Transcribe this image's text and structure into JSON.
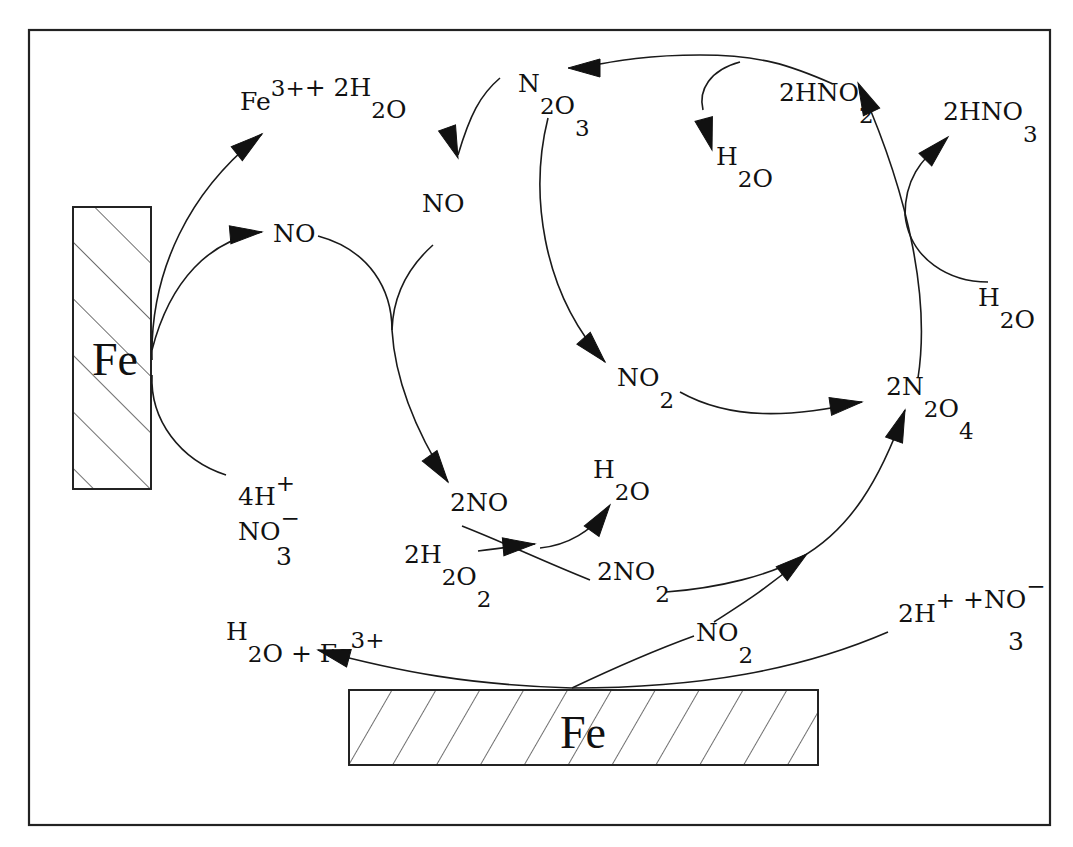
{
  "diagram": {
    "type": "reaction-mechanism",
    "frame": {
      "x": 29,
      "y": 30,
      "width": 1021,
      "height": 795
    },
    "colors": {
      "ink": "#111111",
      "background": "#ffffff"
    },
    "electrodes": [
      {
        "id": "fe-left",
        "label": "Fe",
        "x": 73,
        "y": 207,
        "width": 78,
        "height": 282,
        "hatch": "forward"
      },
      {
        "id": "fe-bottom",
        "label": "Fe",
        "x": 349,
        "y": 690,
        "width": 469,
        "height": 75,
        "hatch": "backward"
      }
    ],
    "species": [
      {
        "id": "fe3-2h2o-top",
        "parts": [
          [
            "Fe",
            ""
          ],
          [
            "3+",
            "sup"
          ],
          [
            "+ 2H",
            ""
          ],
          [
            "2",
            "sub"
          ],
          [
            "O",
            ""
          ]
        ],
        "x": 240,
        "y": 110
      },
      {
        "id": "no-left",
        "parts": [
          [
            "NO",
            ""
          ]
        ],
        "x": 273,
        "y": 242
      },
      {
        "id": "4h-plus",
        "parts": [
          [
            "4H",
            ""
          ],
          [
            "+",
            "sup"
          ]
        ],
        "x": 238,
        "y": 505
      },
      {
        "id": "no3-minus-left",
        "parts": [
          [
            "NO",
            ""
          ],
          [
            "−",
            "sup"
          ]
        ],
        "x": 238,
        "y": 540
      },
      {
        "id": "no3-minus-left-sub",
        "parts": [
          [
            "3",
            ""
          ]
        ],
        "x": 276,
        "y": 565
      },
      {
        "id": "n2o3",
        "parts": [
          [
            "N",
            ""
          ],
          [
            "2",
            "sub"
          ],
          [
            "O",
            ""
          ],
          [
            "3",
            "sub"
          ]
        ],
        "x": 518,
        "y": 92
      },
      {
        "id": "no-middle",
        "parts": [
          [
            "NO",
            ""
          ]
        ],
        "x": 422,
        "y": 212
      },
      {
        "id": "h2o-top",
        "parts": [
          [
            "H",
            ""
          ],
          [
            "2",
            "sub"
          ],
          [
            "O",
            ""
          ]
        ],
        "x": 716,
        "y": 165
      },
      {
        "id": "2hno2",
        "parts": [
          [
            "2HNO",
            ""
          ],
          [
            "2",
            "sub"
          ]
        ],
        "x": 779,
        "y": 101
      },
      {
        "id": "2hno3",
        "parts": [
          [
            "2HNO",
            ""
          ],
          [
            "3",
            "sub"
          ]
        ],
        "x": 943,
        "y": 120
      },
      {
        "id": "h2o-right",
        "parts": [
          [
            "H",
            ""
          ],
          [
            "2",
            "sub"
          ],
          [
            "O",
            ""
          ]
        ],
        "x": 978,
        "y": 306
      },
      {
        "id": "no2-middle",
        "parts": [
          [
            "NO",
            ""
          ],
          [
            "2",
            "sub"
          ]
        ],
        "x": 617,
        "y": 386
      },
      {
        "id": "2n2o4",
        "parts": [
          [
            "2N",
            ""
          ],
          [
            "2",
            "sub"
          ],
          [
            "O",
            ""
          ],
          [
            "4",
            "sub"
          ]
        ],
        "x": 886,
        "y": 395
      },
      {
        "id": "2no",
        "parts": [
          [
            "2NO",
            ""
          ]
        ],
        "x": 450,
        "y": 511
      },
      {
        "id": "h2o-small",
        "parts": [
          [
            "H",
            ""
          ],
          [
            "2",
            "sub"
          ],
          [
            "O",
            ""
          ]
        ],
        "x": 593,
        "y": 478
      },
      {
        "id": "2h2o2",
        "parts": [
          [
            "2H",
            ""
          ],
          [
            "2",
            "sub"
          ],
          [
            "O",
            ""
          ],
          [
            "2",
            "sub"
          ]
        ],
        "x": 404,
        "y": 563
      },
      {
        "id": "2no2",
        "parts": [
          [
            "2NO",
            ""
          ],
          [
            "2",
            "sub"
          ]
        ],
        "x": 597,
        "y": 580
      },
      {
        "id": "h2o-fe3-bottom",
        "parts": [
          [
            "H",
            ""
          ],
          [
            "2",
            "sub"
          ],
          [
            "O + Fe",
            ""
          ],
          [
            "3+",
            "sup"
          ]
        ],
        "x": 226,
        "y": 640
      },
      {
        "id": "no2-bottom",
        "parts": [
          [
            "NO",
            ""
          ],
          [
            "2",
            "sub"
          ]
        ],
        "x": 696,
        "y": 641
      },
      {
        "id": "2h-no3-bottom",
        "parts": [
          [
            "2H",
            ""
          ],
          [
            "+",
            "sup"
          ],
          [
            " +NO",
            ""
          ],
          [
            "−",
            "sup"
          ]
        ],
        "x": 898,
        "y": 622
      },
      {
        "id": "2h-no3-bottom-sub",
        "parts": [
          [
            "3",
            ""
          ]
        ],
        "x": 1008,
        "y": 650
      }
    ],
    "arrows": [
      {
        "id": "fe-to-fe3",
        "d": "M152,360 C150,270 190,190 262,134",
        "head": [
          262,
          134,
          -38
        ]
      },
      {
        "id": "fe-to-no",
        "d": "M152,350 C170,280 210,240 262,232",
        "head": [
          262,
          232,
          -5
        ]
      },
      {
        "id": "h-no3-to-fe",
        "d": "M226,475 C180,460 150,420 152,375",
        "head": null
      },
      {
        "id": "no-to-2no",
        "d": "M318,236 C370,250 392,290 392,330 C395,380 415,430 448,482",
        "head": [
          448,
          482,
          55
        ]
      },
      {
        "id": "n2o3-to-no",
        "d": "M500,78 C480,95 470,115 458,155",
        "head": [
          458,
          158,
          70
        ]
      },
      {
        "id": "no-joins-loop",
        "d": "M433,245 C405,270 393,300 392,330",
        "head": null
      },
      {
        "id": "n2o3-to-no2",
        "d": "M548,118 C530,190 540,290 605,362",
        "head": [
          605,
          362,
          48
        ]
      },
      {
        "id": "no2-to-2n2o4",
        "d": "M680,392 C730,420 790,418 862,402",
        "head": [
          862,
          402,
          -8
        ]
      },
      {
        "id": "2n2o4-to-2hno2",
        "d": "M918,378 C930,300 910,200 862,90",
        "head": [
          858,
          83,
          -115
        ]
      },
      {
        "id": "h2o-to-2hno3",
        "d": "M988,282 C950,282 910,260 905,215 C905,180 920,160 945,140",
        "head": [
          948,
          137,
          -45
        ]
      },
      {
        "id": "2hno2-to-n2o3",
        "d": "M833,84 C790,65 760,55 700,55 C650,55 620,60 577,68",
        "head": [
          568,
          68,
          180
        ]
      },
      {
        "id": "branch-to-h2o",
        "d": "M740,62 C710,70 698,90 703,110",
        "head": [
          712,
          150,
          75
        ]
      },
      {
        "id": "2no-to-2no2",
        "d": "M462,526 C510,545 540,560 590,580",
        "head": null
      },
      {
        "id": "2h2o2-to-junction",
        "d": "M478,551 C500,548 515,546 535,544",
        "head": [
          535,
          544,
          -5
        ]
      },
      {
        "id": "junction-to-h2o",
        "d": "M540,548 C570,545 590,530 607,512",
        "head": [
          610,
          505,
          -55
        ]
      },
      {
        "id": "2no2-to-2n2o4",
        "d": "M666,592 C720,588 770,575 800,558 C850,530 880,480 905,410",
        "head": [
          905,
          410,
          -70
        ]
      },
      {
        "id": "no2-bottom-to-arrow",
        "d": "M714,622 C740,605 765,590 800,560",
        "head": [
          807,
          554,
          -38
        ]
      },
      {
        "id": "surface-to-no2",
        "d": "M572,688 C610,670 650,652 694,636",
        "head": null
      },
      {
        "id": "surface-to-h2o-fe3",
        "d": "M572,688 C470,685 400,672 318,650",
        "head": [
          318,
          650,
          195
        ]
      },
      {
        "id": "h-no3-to-surface",
        "d": "M888,632 C800,670 700,688 572,688",
        "head": null
      }
    ]
  }
}
